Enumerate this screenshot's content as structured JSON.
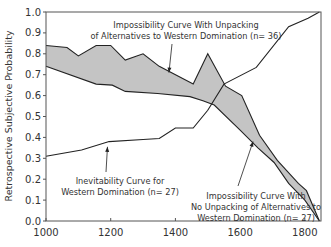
{
  "chart_data": {
    "type": "line",
    "title": "",
    "xlabel": "",
    "ylabel": "Retrospective Subjective Probability",
    "xlim": [
      1000,
      1850
    ],
    "ylim": [
      0.0,
      1.0
    ],
    "grid": false,
    "legend": "none (inline annotations)",
    "x_ticks": [
      1000,
      1200,
      1400,
      1600,
      1800
    ],
    "x_tick_labels": [
      "1000",
      "1200",
      "1400",
      "1600",
      "1800"
    ],
    "y_ticks": [
      0.0,
      0.1,
      0.2,
      0.3,
      0.4,
      0.5,
      0.6,
      0.7,
      0.8,
      0.9,
      1.0
    ],
    "y_tick_labels": [
      "0.0",
      "0.1",
      "0.2",
      "0.3",
      "0.4",
      "0.5",
      "0.6",
      "0.7",
      "0.8",
      "0.9",
      "1.0"
    ],
    "shaded_band": {
      "between": [
        "Impossibility Curve With Unpacking of Alternatives to Western Domination (n= 36)",
        "Impossibility Curve With No Unpacking of Alternatives to Western Domination (n= 27)"
      ],
      "fill": "#c4c4c4"
    },
    "series": [
      {
        "name": "Impossibility Curve With Unpacking of Alternatives to Western Domination (n= 36)",
        "color": "#222222",
        "x": [
          1000,
          1065,
          1100,
          1155,
          1200,
          1245,
          1300,
          1350,
          1455,
          1500,
          1555,
          1605,
          1660,
          1715,
          1780,
          1805,
          1845
        ],
        "y": [
          0.84,
          0.83,
          0.79,
          0.84,
          0.84,
          0.77,
          0.8,
          0.74,
          0.655,
          0.8,
          0.645,
          0.6,
          0.41,
          0.29,
          0.18,
          0.145,
          0.0
        ]
      },
      {
        "name": "Impossibility Curve With No Unpacking of Alternatives to Western Domination (n= 27)",
        "color": "#222222",
        "x": [
          1000,
          1155,
          1205,
          1245,
          1345,
          1445,
          1485,
          1520,
          1600,
          1655,
          1705,
          1750,
          1800,
          1845
        ],
        "y": [
          0.74,
          0.655,
          0.65,
          0.62,
          0.61,
          0.595,
          0.575,
          0.555,
          0.435,
          0.35,
          0.28,
          0.18,
          0.1,
          0.0
        ]
      },
      {
        "name": "Inevitability Curve for Western Domination (n= 27)",
        "color": "#222222",
        "x": [
          1000,
          1110,
          1195,
          1300,
          1350,
          1400,
          1455,
          1500,
          1550,
          1650,
          1750,
          1810,
          1845
        ],
        "y": [
          0.31,
          0.34,
          0.38,
          0.39,
          0.395,
          0.445,
          0.445,
          0.53,
          0.655,
          0.735,
          0.93,
          0.97,
          1.0
        ]
      }
    ],
    "annotations": [
      {
        "id": "unpack",
        "lines": [
          "Impossibility Curve With Unpacking",
          "of Alternatives to Western Domination (n= 36)"
        ],
        "arrow_to": [
          1380,
          0.71
        ]
      },
      {
        "id": "inevit",
        "lines": [
          "Inevitability Curve for",
          "Western Domination (n= 27)"
        ],
        "arrow_to": [
          1190,
          0.355
        ]
      },
      {
        "id": "nounpack",
        "lines": [
          "Impossibility Curve With",
          "No Unpacking of Alternatives to",
          "Western Domination (n= 27)"
        ],
        "arrow_to": [
          1640,
          0.38
        ]
      }
    ]
  }
}
